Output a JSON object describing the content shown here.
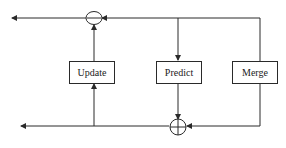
{
  "diagram": {
    "blocks": {
      "update": {
        "label": "Update"
      },
      "predict": {
        "label": "Predict"
      },
      "merge": {
        "label": "Merge"
      }
    },
    "junctions": {
      "subtract": {
        "symbol": "minus",
        "label": "−"
      },
      "add": {
        "symbol": "plus",
        "label": "+"
      }
    },
    "colors": {
      "line": "#2a2a2a",
      "background": "#ffffff"
    }
  }
}
